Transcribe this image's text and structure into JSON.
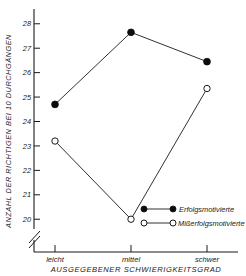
{
  "chart_data": {
    "type": "line",
    "title": "",
    "xlabel": "AUSGEGEBENER SCHWIERIGKEITSGRAD",
    "ylabel": "ANZAHL DER RICHTIGEN BEI 10 DURCHGÄNGEN",
    "categories": [
      "leicht",
      "mittel",
      "schwer"
    ],
    "ylim": [
      19.6,
      28.4
    ],
    "yticks": [
      "28",
      "27",
      "26",
      "25",
      "24",
      "23",
      "22",
      "21",
      "20"
    ],
    "ytick_values": [
      28,
      27,
      26,
      25,
      24,
      23,
      22,
      21,
      20
    ],
    "grid": false,
    "axis_break": true,
    "legend_position": "lower-right",
    "series": [
      {
        "name": "Erfolgsmotivierte",
        "marker": "filled-circle",
        "values": [
          24.7,
          27.65,
          26.45
        ]
      },
      {
        "name": "Mißerfolgsmotivierte",
        "marker": "open-circle",
        "values": [
          23.2,
          20.0,
          25.35
        ]
      }
    ]
  },
  "legend": {
    "items": [
      {
        "label": "Erfolgsmotivierte",
        "marker": "filled-circle"
      },
      {
        "label": "Mißerfolgsmotivierte",
        "marker": "open-circle"
      }
    ]
  }
}
